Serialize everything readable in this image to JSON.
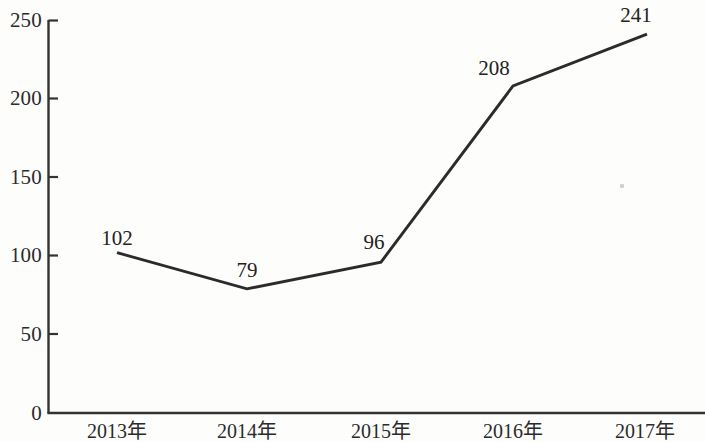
{
  "chart_data": {
    "type": "line",
    "title": "",
    "xlabel": "",
    "ylabel": "",
    "categories": [
      "2013年",
      "2014年",
      "2015年",
      "2016年",
      "2017年"
    ],
    "values": [
      102,
      79,
      96,
      208,
      241
    ],
    "point_labels": [
      "102",
      "79",
      "96",
      "208",
      "241"
    ],
    "ylim": [
      0,
      250
    ],
    "y_ticks": [
      0,
      50,
      100,
      150,
      200,
      250
    ],
    "y_tick_labels": [
      "0",
      "50",
      "100",
      "150",
      "200",
      "250"
    ],
    "grid": false,
    "legend": false,
    "series": [
      {
        "name": "",
        "values": [
          102,
          79,
          96,
          208,
          241
        ]
      }
    ],
    "line_color": "#2b2b2b",
    "axis_color": "#333333",
    "background_color": "#fdfdfc"
  }
}
